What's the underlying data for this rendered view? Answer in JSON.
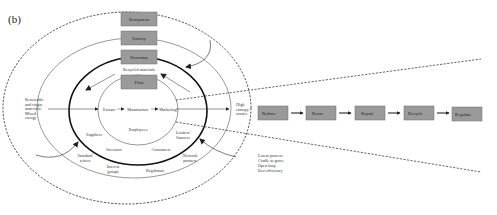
{
  "panel_label": "(b)",
  "colors": {
    "box_fill": "#9a9a9a",
    "box_stroke": "#6e6e6e",
    "line": "#222222"
  },
  "layers": {
    "ecosystem": "Ecosystem",
    "society": "Society",
    "economy": "Economy",
    "firm": "Firm"
  },
  "center_flow": {
    "extract": "Extract",
    "manufacture": "Manufacture",
    "marketing": "Marketing"
  },
  "recycled_materials": "Recycled materials",
  "inputs": {
    "line1": "Renewable",
    "line2": "and virgin",
    "line3": "materials/",
    "line4": "Mixed",
    "line5": "energy"
  },
  "outputs": {
    "line1": "High",
    "line2": "entropy",
    "line3": "wastes"
  },
  "stakeholders": {
    "employees": "Employees",
    "suppliers": "Suppliers",
    "lenders_line1": "Lenders/",
    "lenders_line2": "Insurers",
    "investors": "Investors",
    "consumers": "Consumers",
    "standard_setters_line1": "Standard",
    "standard_setters_line2": "setters",
    "network_partners_line1": "Network",
    "network_partners_line2": "partners",
    "interest_groups_line1": "Interest",
    "interest_groups_line2": "groups",
    "regulators": "Regulators"
  },
  "process_notes": {
    "line1": "Linear process",
    "line2": "Cradle to grave",
    "line3": "Open loop",
    "line4": "Eco-efficiency"
  },
  "r_chain": [
    "Reduce",
    "Reuse",
    "Repair",
    "Recycle",
    "Regulate"
  ]
}
